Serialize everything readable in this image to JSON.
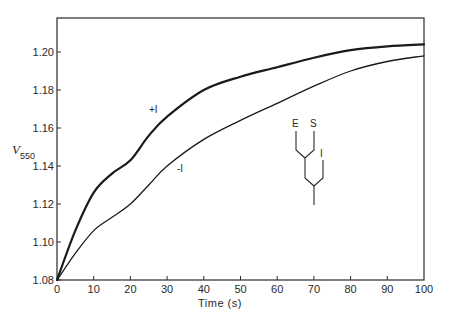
{
  "chart_data": {
    "type": "line",
    "title": "",
    "xlabel": "Time (s)",
    "ylabel": "V550",
    "ylabel_main": "V",
    "ylabel_sub": "550",
    "xlim": [
      0,
      100
    ],
    "ylim": [
      1.08,
      1.22
    ],
    "x_ticks": [
      0,
      10,
      20,
      30,
      40,
      50,
      60,
      70,
      80,
      90,
      100
    ],
    "y_ticks": [
      1.08,
      1.1,
      1.12,
      1.14,
      1.16,
      1.18,
      1.2
    ],
    "y_tick_labels": [
      "1.08",
      "1.10",
      "1.12",
      "1.14",
      "1.16",
      "1.18",
      "1.20"
    ],
    "grid": false,
    "legend": "none (inline curve labels)",
    "x": [
      0,
      5,
      10,
      15,
      20,
      25,
      30,
      40,
      50,
      60,
      70,
      80,
      90,
      100
    ],
    "series": [
      {
        "name": "+I",
        "line_weight": "thick",
        "values": [
          1.08,
          1.106,
          1.126,
          1.136,
          1.143,
          1.156,
          1.166,
          1.18,
          1.187,
          1.192,
          1.197,
          1.201,
          1.203,
          1.204
        ]
      },
      {
        "name": "-I",
        "line_weight": "thin",
        "values": [
          1.08,
          1.094,
          1.106,
          1.113,
          1.12,
          1.13,
          1.14,
          1.154,
          1.164,
          1.173,
          1.182,
          1.19,
          1.195,
          1.198
        ]
      }
    ],
    "annotations": [
      {
        "text": "+I",
        "near_series": "+I",
        "at_x": 26
      },
      {
        "text": "-I",
        "near_series": "-I",
        "at_x": 33
      },
      {
        "text": "E S I branching scheme",
        "type": "diagram",
        "labels": [
          "E",
          "S",
          "I"
        ],
        "at_x": 68,
        "at_y": 1.145
      }
    ]
  },
  "labels": {
    "x_axis_title": "Time (s)",
    "curve_plus": "+I",
    "curve_minus": "-I",
    "scheme_e": "E",
    "scheme_s": "S",
    "scheme_i": "I"
  }
}
